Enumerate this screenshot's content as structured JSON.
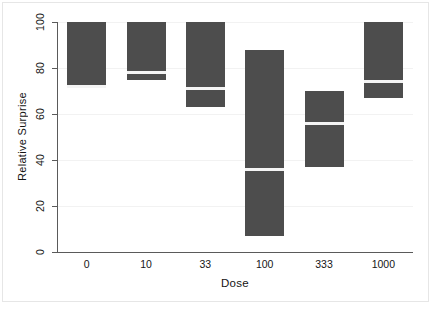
{
  "chart_data": {
    "type": "bar",
    "title": "",
    "subtitle": "",
    "xlabel": "Dose",
    "ylabel": "Relative Surprise",
    "categories": [
      "0",
      "10",
      "33",
      "100",
      "333",
      "1000"
    ],
    "xlim_categorical": true,
    "ylim": [
      0,
      100
    ],
    "yticks": [
      0,
      20,
      40,
      60,
      80,
      100
    ],
    "ytick_labels": [
      "0",
      "20",
      "40",
      "60",
      "80",
      "100"
    ],
    "grid": true,
    "legend": null,
    "legend_position": "none",
    "bar_color": "#4d4d4d",
    "median_line_color": "#f4f4f4",
    "series": [
      {
        "name": "Relative Surprise interval",
        "bars": [
          {
            "category": "0",
            "low": 72,
            "high": 100,
            "median": 72
          },
          {
            "category": "10",
            "low": 75,
            "high": 100,
            "median": 78
          },
          {
            "category": "33",
            "low": 63,
            "high": 100,
            "median": 71
          },
          {
            "category": "100",
            "low": 7,
            "high": 88,
            "median": 36
          },
          {
            "category": "333",
            "low": 37,
            "high": 70,
            "median": 56
          },
          {
            "category": "1000",
            "low": 67,
            "high": 100,
            "median": 74
          }
        ]
      }
    ]
  },
  "axes": {
    "y_title": "Relative Surprise",
    "x_title": "Dose"
  }
}
